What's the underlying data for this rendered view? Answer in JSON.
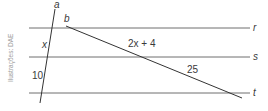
{
  "diagram": {
    "credit": "Ilustrações: DAE",
    "parallel_lines": [
      {
        "name": "r",
        "label": "r"
      },
      {
        "name": "s",
        "label": "s"
      },
      {
        "name": "t",
        "label": "t"
      }
    ],
    "transversals": [
      {
        "name": "a",
        "label": "a"
      },
      {
        "name": "b",
        "label": "b"
      }
    ],
    "segments": {
      "a_between_r_s": "x",
      "a_between_s_t": "10",
      "b_between_r_s": "2x + 4",
      "b_between_s_t": "25"
    },
    "colors": {
      "parallel_line": "#6e6e6e",
      "transversal": "#333333",
      "text": "#3a3a3a"
    }
  }
}
